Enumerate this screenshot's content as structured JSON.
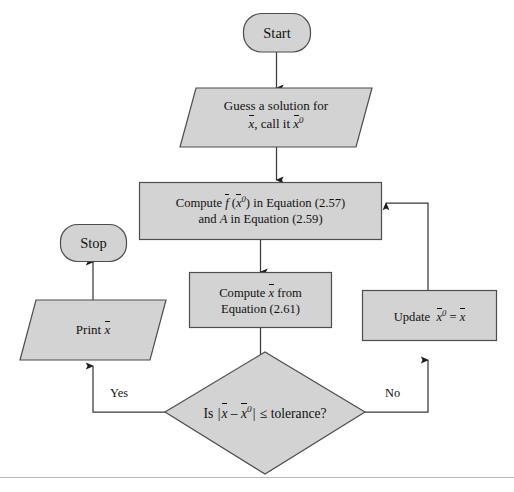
{
  "diagram": {
    "colors": {
      "node_fill": "#d3d3d3",
      "node_stroke": "#4d4d4d",
      "line": "#3a3a3a",
      "page_background": "#ffffff",
      "baseline_rule": "#b9b9b9"
    },
    "nodes": {
      "start": {
        "shape": "terminal",
        "label": "Start"
      },
      "guess": {
        "shape": "parallelogram",
        "line1": "Guess a solution for",
        "line2_prefix": "",
        "line2_var": "x",
        "line2_mid": ", call it ",
        "line2_var2": "x",
        "line2_sup": "0"
      },
      "compute_f": {
        "shape": "process",
        "line1_prefix": "Compute ",
        "line1_f": "f",
        "line1_mid": " (",
        "line1_x": "x",
        "line1_sup": "0",
        "line1_suffix": ") in Equation (2.57)",
        "line2_prefix": "and ",
        "line2_A": "A",
        "line2_suffix": " in Equation (2.59)"
      },
      "compute_x": {
        "shape": "process",
        "line1_prefix": "Compute ",
        "line1_x": "x",
        "line1_suffix": " from",
        "line2": "Equation (2.61)"
      },
      "decision": {
        "shape": "diamond",
        "prefix": "Is ",
        "bar_open": "|",
        "x1": "x",
        "minus": " – ",
        "x2": "x",
        "sup": "0",
        "bar_close": "|",
        "suffix": " ≤ tolerance?"
      },
      "update": {
        "shape": "process",
        "prefix": "Update",
        "x0": "x",
        "sup": "0",
        "equals": " = ",
        "x1": "x"
      },
      "print": {
        "shape": "parallelogram",
        "prefix": "Print ",
        "x": "x"
      },
      "stop": {
        "shape": "terminal",
        "label": "Stop"
      }
    },
    "edges": [
      {
        "id": "start-to-guess",
        "label": ""
      },
      {
        "id": "guess-to-compute-f",
        "label": ""
      },
      {
        "id": "compute-f-to-compute-x",
        "label": ""
      },
      {
        "id": "compute-x-to-decision",
        "label": ""
      },
      {
        "id": "decision-to-print",
        "label": "Yes"
      },
      {
        "id": "decision-to-update",
        "label": "No"
      },
      {
        "id": "update-to-compute-f",
        "label": ""
      },
      {
        "id": "print-to-stop",
        "label": ""
      }
    ],
    "edge_labels": {
      "yes": "Yes",
      "no": "No"
    }
  }
}
